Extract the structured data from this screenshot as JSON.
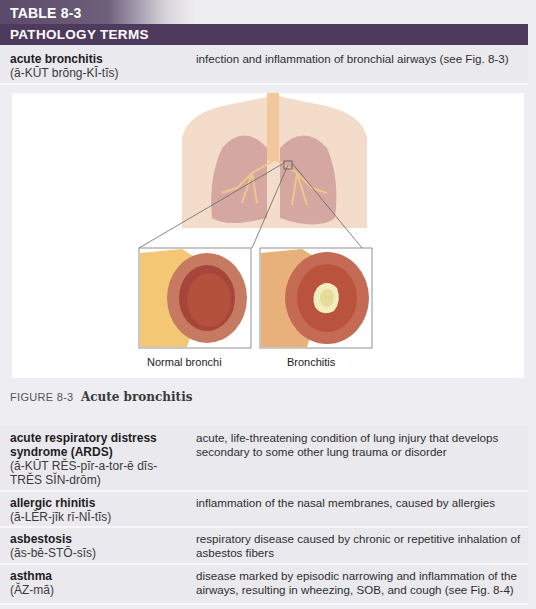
{
  "table": {
    "label": "TABLE 8-3",
    "title": "PATHOLOGY TERMS"
  },
  "rows": [
    {
      "term": "acute bronchitis",
      "pronunciation": "(ā-KŪT brŏng-KĪ-tĭs)",
      "definition": "infection and inflammation of bronchial airways (see Fig. 8-3)"
    },
    {
      "term": "acute respiratory distress syndrome (ARDS)",
      "pronunciation": "(ă-KŪT RĔS-pĭr-a-tor-ē dĭs-TRĔS SĬN-drōm)",
      "definition": "acute, life-threatening condition of lung injury that develops secondary to some other lung trauma or disorder"
    },
    {
      "term": "allergic rhinitis",
      "pronunciation": "(ă-LĔR-jĭk rī-NĪ-tĭs)",
      "definition": "inflammation of the nasal membranes, caused by allergies"
    },
    {
      "term": "asbestosis",
      "pronunciation": "(ăs-bĕ-STŌ-sĭs)",
      "definition": "respiratory disease caused by chronic or repetitive inhalation of asbestos fibers"
    },
    {
      "term": "asthma",
      "pronunciation": "(ĂZ-mă)",
      "definition": "disease marked by episodic narrowing and inflammation of the airways, resulting in wheezing, SOB, and cough (see Fig. 8-4)"
    }
  ],
  "figure": {
    "number": "FIGURE 8-3",
    "title": "Acute bronchitis",
    "panels": [
      {
        "label": "Normal bronchi"
      },
      {
        "label": "Bronchitis"
      }
    ]
  },
  "colors": {
    "header_purple": "#4e3a5c",
    "row_bg": "#eae9ee"
  }
}
